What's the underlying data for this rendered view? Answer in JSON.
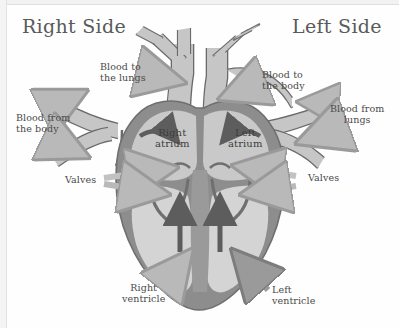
{
  "diagram": {
    "titles": {
      "right": "Right Side",
      "left": "Left Side"
    },
    "callouts": {
      "blood_to_lungs": "Blood to\nthe lungs",
      "blood_from_body": "Blood from\nthe body",
      "blood_to_body": "Blood to\nthe body",
      "blood_from_lungs": "Blood from\nlungs",
      "valves_left": "Valves",
      "valves_right": "Valves",
      "right_ventricle": "Right\nventricle",
      "left_ventricle": "Left\nventricle"
    },
    "chambers": {
      "right_atrium": "Right\natrium",
      "left_atrium": "Left\natrium"
    },
    "colors": {
      "background": "#fefefe",
      "myocardium": "#8d8d8d",
      "myocardium_dark": "#6f6f6f",
      "chamber_fill": "#cfcfcf",
      "vessel_outline": "#6a6a6a",
      "vessel_fill": "#c6c6c6",
      "flow_arrow": "#5d5d5d",
      "pointer_arrow": "#b4b4b4",
      "pointer_arrow_dark": "#8f8f8f",
      "text": "#4a4a4a"
    }
  }
}
